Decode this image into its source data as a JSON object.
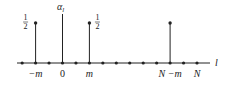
{
  "diagram": {
    "type": "stem-plot",
    "axis_label": "l",
    "stem_axis_label": "α_l",
    "stem_axis_label_main": "α",
    "stem_axis_label_sub": "l",
    "axis_dot_indices": [
      -3,
      -2,
      -1,
      0,
      1,
      2,
      3,
      4,
      5,
      6,
      7,
      8,
      9,
      10
    ],
    "stems": [
      {
        "index": -2,
        "value_label": "1/2",
        "label_num": "1",
        "label_den": "2",
        "label_side": "left",
        "has_dot": true
      },
      {
        "index": 2,
        "value_label": "1/2",
        "label_num": "1",
        "label_den": "2",
        "label_side": "right",
        "has_dot": true
      },
      {
        "index": 8,
        "value_label": "",
        "has_dot": true
      }
    ],
    "tick_labels": [
      {
        "index": -2,
        "text": "−m"
      },
      {
        "index": 0,
        "text": "0"
      },
      {
        "index": 2,
        "text": "m"
      },
      {
        "index": 8,
        "text": "N −m"
      },
      {
        "index": 10,
        "text": "N"
      }
    ],
    "colors": {
      "ink": "#222222"
    }
  }
}
